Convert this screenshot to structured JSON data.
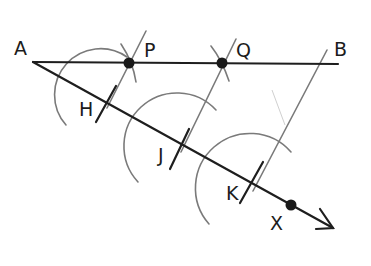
{
  "diagram": {
    "type": "geometric-construction",
    "labels": {
      "A": "A",
      "B": "B",
      "P": "P",
      "Q": "Q",
      "H": "H",
      "J": "J",
      "K": "K",
      "X": "X"
    },
    "points": {
      "A": [
        33,
        62
      ],
      "B_end": [
        338,
        64
      ],
      "P": [
        129,
        63
      ],
      "Q": [
        222,
        63
      ],
      "H": [
        109,
        104
      ],
      "J": [
        183,
        147
      ],
      "K": [
        255,
        185
      ],
      "X": [
        291,
        205
      ],
      "ray_tip": [
        333,
        228
      ]
    },
    "segments": [
      {
        "name": "segment-AB",
        "from": "A",
        "to": "B_end",
        "style": "main"
      },
      {
        "name": "ray-AX",
        "from": "A",
        "to": "ray_tip",
        "style": "main",
        "arrow": true
      }
    ],
    "parallels": [
      {
        "name": "parallel-KB",
        "through": "K",
        "to": "B"
      },
      {
        "name": "parallel-JQ",
        "through": "J",
        "to": "Q"
      },
      {
        "name": "parallel-HP",
        "through": "H",
        "to": "P"
      }
    ],
    "colors": {
      "main_line": "#1e1e1e",
      "construction_line": "#7a7a7a",
      "background": "#ffffff"
    }
  }
}
